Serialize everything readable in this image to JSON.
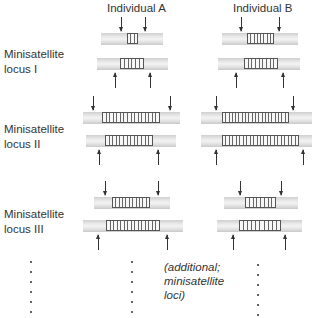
{
  "headers": {
    "individual_a": "Individual A",
    "individual_b": "Individual B"
  },
  "loci": [
    {
      "label_line1": "Minisatellite",
      "label_line2": "locus I"
    },
    {
      "label_line1": "Minisatellite",
      "label_line2": "locus II"
    },
    {
      "label_line1": "Minisatellite",
      "label_line2": "locus III"
    }
  ],
  "additional_note": {
    "line1": "(additional;",
    "line2": "minisatellite",
    "line3": "loci)"
  },
  "colors": {
    "bar": "#e0e0e0",
    "repeat_stroke": "#555555",
    "arrow": "#333333"
  },
  "alleles": [
    {
      "locus": "I",
      "individual": "A",
      "strand": "top",
      "bar": [
        101,
        33,
        62
      ],
      "repeat": [
        127,
        11
      ],
      "units": 3,
      "arrows": [
        121,
        145
      ],
      "dir": "down"
    },
    {
      "locus": "I",
      "individual": "A",
      "strand": "bottom",
      "bar": [
        97,
        58,
        71
      ],
      "repeat": [
        120,
        24
      ],
      "units": 6,
      "arrows": [
        115,
        150
      ],
      "dir": "up"
    },
    {
      "locus": "I",
      "individual": "B",
      "strand": "top",
      "bar": [
        222,
        33,
        76
      ],
      "repeat": [
        247,
        27
      ],
      "units": 8,
      "arrows": [
        241,
        279
      ],
      "dir": "down"
    },
    {
      "locus": "I",
      "individual": "B",
      "strand": "bottom",
      "bar": [
        218,
        58,
        82
      ],
      "repeat": [
        244,
        34
      ],
      "units": 9,
      "arrows": [
        236,
        283
      ],
      "dir": "up"
    },
    {
      "locus": "II",
      "individual": "A",
      "strand": "top",
      "bar": [
        83,
        112,
        97
      ],
      "repeat": [
        102,
        58
      ],
      "units": 16,
      "arrows": [
        93,
        170
      ],
      "dir": "down"
    },
    {
      "locus": "II",
      "individual": "A",
      "strand": "bottom",
      "bar": [
        86,
        135,
        90
      ],
      "repeat": [
        105,
        48
      ],
      "units": 13,
      "arrows": [
        99,
        158
      ],
      "dir": "up"
    },
    {
      "locus": "II",
      "individual": "B",
      "strand": "top",
      "bar": [
        201,
        112,
        111
      ],
      "repeat": [
        222,
        67
      ],
      "units": 20,
      "arrows": [
        216,
        293
      ],
      "dir": "down"
    },
    {
      "locus": "II",
      "individual": "B",
      "strand": "bottom",
      "bar": [
        201,
        135,
        111
      ],
      "repeat": [
        222,
        77
      ],
      "units": 22,
      "arrows": [
        216,
        303
      ],
      "dir": "up"
    },
    {
      "locus": "III",
      "individual": "A",
      "strand": "top",
      "bar": [
        94,
        197,
        76
      ],
      "repeat": [
        112,
        38
      ],
      "units": 11,
      "arrows": [
        105,
        158
      ],
      "dir": "down"
    },
    {
      "locus": "III",
      "individual": "A",
      "strand": "bottom",
      "bar": [
        83,
        220,
        100
      ],
      "repeat": [
        106,
        54
      ],
      "units": 15,
      "arrows": [
        98,
        167
      ],
      "dir": "up"
    },
    {
      "locus": "III",
      "individual": "B",
      "strand": "top",
      "bar": [
        224,
        197,
        74
      ],
      "repeat": [
        245,
        31
      ],
      "units": 8,
      "arrows": [
        240,
        281
      ],
      "dir": "down"
    },
    {
      "locus": "III",
      "individual": "B",
      "strand": "bottom",
      "bar": [
        217,
        220,
        85
      ],
      "repeat": [
        239,
        42
      ],
      "units": 10,
      "arrows": [
        233,
        285
      ],
      "dir": "up"
    }
  ]
}
